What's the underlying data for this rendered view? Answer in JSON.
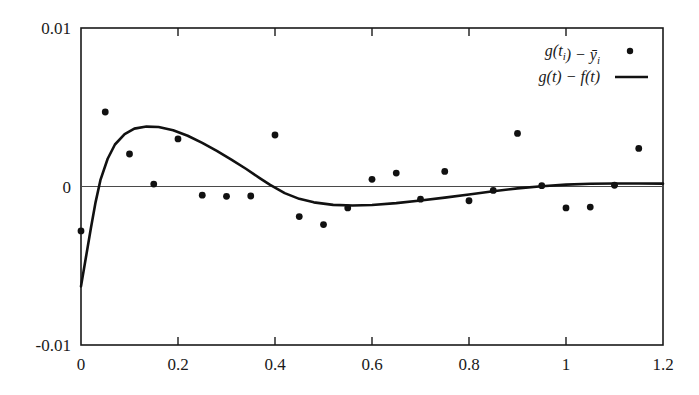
{
  "chart_data": {
    "type": "scatter",
    "title": "",
    "xlabel": "",
    "ylabel": "",
    "xlim": [
      0,
      1.2
    ],
    "ylim": [
      -0.01,
      0.01
    ],
    "grid": false,
    "legend_position": "top-right",
    "xticks": [
      "0",
      "0.2",
      "0.4",
      "0.6",
      "0.8",
      "1",
      "1.2"
    ],
    "xtick_values": [
      0,
      0.2,
      0.4,
      0.6,
      0.8,
      1.0,
      1.2
    ],
    "yticks": [
      "0.01",
      "0",
      "-0.01"
    ],
    "ytick_values": [
      0.01,
      0,
      -0.01
    ],
    "zero_line": 0,
    "series": [
      {
        "name": "g(t_i) - ÿ_i",
        "legend_label": "g(t_i) − ỹ_i",
        "marker": "dot",
        "style": "points",
        "color": "#111111",
        "points": [
          {
            "x": 0.0,
            "y": -0.0028
          },
          {
            "x": 0.05,
            "y": 0.0047
          },
          {
            "x": 0.1,
            "y": 0.00205
          },
          {
            "x": 0.15,
            "y": 0.00015
          },
          {
            "x": 0.2,
            "y": 0.003
          },
          {
            "x": 0.25,
            "y": -0.00055
          },
          {
            "x": 0.3,
            "y": -0.00062
          },
          {
            "x": 0.35,
            "y": -0.0006
          },
          {
            "x": 0.4,
            "y": 0.00325
          },
          {
            "x": 0.45,
            "y": -0.0019
          },
          {
            "x": 0.5,
            "y": -0.0024
          },
          {
            "x": 0.55,
            "y": -0.00135
          },
          {
            "x": 0.6,
            "y": 0.00045
          },
          {
            "x": 0.65,
            "y": 0.00085
          },
          {
            "x": 0.7,
            "y": -0.0008
          },
          {
            "x": 0.75,
            "y": 0.00095
          },
          {
            "x": 0.8,
            "y": -0.0009
          },
          {
            "x": 0.85,
            "y": -0.00025
          },
          {
            "x": 0.9,
            "y": 0.00335
          },
          {
            "x": 0.95,
            "y": 5e-05
          },
          {
            "x": 1.0,
            "y": -0.00135
          },
          {
            "x": 1.05,
            "y": -0.0013
          },
          {
            "x": 1.1,
            "y": 8e-05
          },
          {
            "x": 1.15,
            "y": 0.0024
          }
        ]
      },
      {
        "name": "g(t) - f(t)",
        "legend_label": "g(t) − f(t)",
        "marker": "none",
        "style": "line",
        "color": "#111111",
        "curve": [
          {
            "x": 0.0,
            "y": -0.0063
          },
          {
            "x": 0.01,
            "y": -0.0045
          },
          {
            "x": 0.02,
            "y": -0.0027
          },
          {
            "x": 0.03,
            "y": -0.001
          },
          {
            "x": 0.04,
            "y": 0.0004
          },
          {
            "x": 0.055,
            "y": 0.00175
          },
          {
            "x": 0.07,
            "y": 0.00265
          },
          {
            "x": 0.09,
            "y": 0.0033
          },
          {
            "x": 0.11,
            "y": 0.00365
          },
          {
            "x": 0.135,
            "y": 0.00378
          },
          {
            "x": 0.16,
            "y": 0.00375
          },
          {
            "x": 0.19,
            "y": 0.00355
          },
          {
            "x": 0.22,
            "y": 0.0032
          },
          {
            "x": 0.25,
            "y": 0.00275
          },
          {
            "x": 0.28,
            "y": 0.00225
          },
          {
            "x": 0.31,
            "y": 0.0017
          },
          {
            "x": 0.34,
            "y": 0.00112
          },
          {
            "x": 0.37,
            "y": 0.0005
          },
          {
            "x": 0.39,
            "y": 0.0001
          },
          {
            "x": 0.42,
            "y": -0.00042
          },
          {
            "x": 0.45,
            "y": -0.00078
          },
          {
            "x": 0.48,
            "y": -0.001
          },
          {
            "x": 0.52,
            "y": -0.00116
          },
          {
            "x": 0.56,
            "y": -0.0012
          },
          {
            "x": 0.6,
            "y": -0.00117
          },
          {
            "x": 0.65,
            "y": -0.00105
          },
          {
            "x": 0.7,
            "y": -0.00088
          },
          {
            "x": 0.75,
            "y": -0.0007
          },
          {
            "x": 0.8,
            "y": -0.0005
          },
          {
            "x": 0.85,
            "y": -0.0003
          },
          {
            "x": 0.9,
            "y": -0.00012
          },
          {
            "x": 0.95,
            "y": 2e-05
          },
          {
            "x": 1.0,
            "y": 0.00012
          },
          {
            "x": 1.05,
            "y": 0.00017
          },
          {
            "x": 1.1,
            "y": 0.00019
          },
          {
            "x": 1.15,
            "y": 0.00019
          },
          {
            "x": 1.2,
            "y": 0.00018
          }
        ]
      }
    ]
  }
}
